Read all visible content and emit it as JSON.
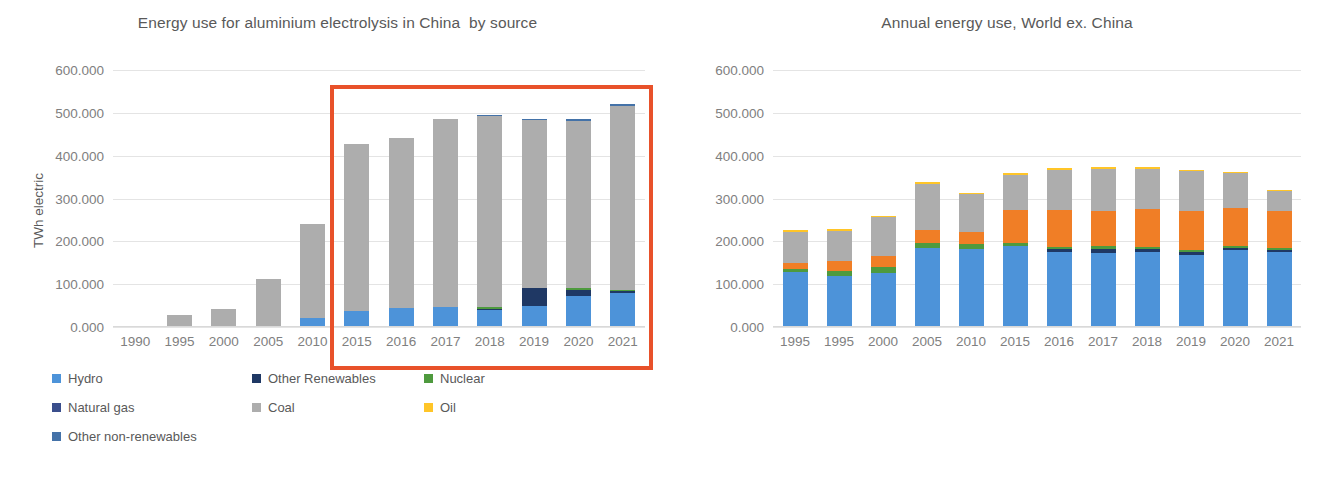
{
  "chart_data": [
    {
      "id": "china",
      "type": "bar",
      "stacked": true,
      "title": "Energy use for aluminium electrolysis in China  by source",
      "xlabel": "",
      "ylabel": "TWh electric",
      "ylim": [
        0,
        600
      ],
      "yticks": [
        "0.000",
        "100.000",
        "200.000",
        "300.000",
        "400.000",
        "500.000",
        "600.000"
      ],
      "ytick_values": [
        0,
        100,
        200,
        300,
        400,
        500,
        600
      ],
      "grid": true,
      "legend_position": "bottom",
      "categories": [
        "1990",
        "1995",
        "2000",
        "2005",
        "2010",
        "2015",
        "2016",
        "2017",
        "2018",
        "2019",
        "2020",
        "2021"
      ],
      "series": [
        {
          "name": "Hydro",
          "color": "#4D93D9",
          "values": [
            0,
            0,
            0,
            3.0,
            22.0,
            38.0,
            45.0,
            47.0,
            40.0,
            50.0,
            73.0,
            80.0
          ]
        },
        {
          "name": "Other Renewables",
          "color": "#1F3864",
          "values": [
            0,
            0,
            0,
            0,
            0,
            0,
            0,
            0,
            2.0,
            41.0,
            14.0,
            3.0
          ]
        },
        {
          "name": "Nuclear",
          "color": "#4E9A3E",
          "values": [
            0,
            0,
            0,
            0,
            0,
            0,
            0,
            0,
            4.0,
            1.0,
            3.0,
            4.0
          ]
        },
        {
          "name": "Natural gas",
          "color": "#3A4E8C",
          "values": [
            0,
            0,
            0,
            0,
            0,
            0,
            0,
            0,
            0,
            0,
            0,
            0
          ]
        },
        {
          "name": "Coal",
          "color": "#ADADAD",
          "values": [
            0,
            28.0,
            43.0,
            109.0,
            218.0,
            389.0,
            396.0,
            438.0,
            446.0,
            392.0,
            392.0,
            429.0
          ]
        },
        {
          "name": "Oil",
          "color": "#FFC528",
          "values": [
            0,
            0,
            0,
            0,
            0,
            0,
            0,
            0,
            0,
            0,
            0,
            0
          ]
        },
        {
          "name": "Other non-renewables",
          "color": "#4472A8",
          "values": [
            0,
            0,
            0,
            0,
            0,
            0,
            0,
            0,
            3.0,
            2.0,
            4.0,
            4.0
          ]
        }
      ],
      "totals": [
        0,
        28,
        43,
        112,
        240,
        427,
        441,
        485,
        495,
        486,
        486,
        520
      ],
      "highlight": {
        "label": "2015-2021 highlight box",
        "color": "#E8512A",
        "from": "2015",
        "to": "2021"
      },
      "legend": [
        {
          "label": "Hydro",
          "color": "#4D93D9"
        },
        {
          "label": "Other Renewables",
          "color": "#1F3864"
        },
        {
          "label": "Nuclear",
          "color": "#4E9A3E"
        },
        {
          "label": "Natural gas",
          "color": "#3A4E8C"
        },
        {
          "label": "Coal",
          "color": "#ADADAD"
        },
        {
          "label": "Oil",
          "color": "#FFC528"
        },
        {
          "label": "Other non-renewables",
          "color": "#4472A8"
        }
      ]
    },
    {
      "id": "world",
      "type": "bar",
      "stacked": true,
      "title": "Annual energy use, World ex. China",
      "xlabel": "",
      "ylabel": "TWh electric",
      "ylim": [
        0,
        600
      ],
      "yticks": [
        "0.000",
        "100.000",
        "200.000",
        "300.000",
        "400.000",
        "500.000",
        "600.000"
      ],
      "ytick_values": [
        0,
        100,
        200,
        300,
        400,
        500,
        600
      ],
      "grid": true,
      "legend_position": "bottom",
      "categories": [
        "1995",
        "1995",
        "2000",
        "2005",
        "2010",
        "2015",
        "2016",
        "2017",
        "2018",
        "2019",
        "2020",
        "2021"
      ],
      "series": [
        {
          "name": "Hydro",
          "color": "#4D93D9",
          "values": [
            128.0,
            120.0,
            127.0,
            185.0,
            182.0,
            188.0,
            175.0,
            172.0,
            176.0,
            168.0,
            180.0,
            176.0
          ]
        },
        {
          "name": "Other Renewables",
          "color": "#1F3864",
          "values": [
            0,
            0,
            0,
            0,
            0,
            0,
            7.0,
            10.0,
            5.0,
            6.0,
            4.0,
            3.0
          ]
        },
        {
          "name": "Nuclear",
          "color": "#4E9A3E",
          "values": [
            8.0,
            10.0,
            12.0,
            12.0,
            11.0,
            9.0,
            6.0,
            6.0,
            6.0,
            5.0,
            5.0,
            5.0
          ]
        },
        {
          "name": "Natural gas",
          "color": "#F07E26",
          "values": [
            14.0,
            25.0,
            26.0,
            30.0,
            28.0,
            77.0,
            85.0,
            84.0,
            89.0,
            92.0,
            90.0,
            86.0
          ]
        },
        {
          "name": "Coal",
          "color": "#ADADAD",
          "values": [
            72.0,
            69.0,
            91.0,
            107.0,
            89.0,
            82.0,
            94.0,
            98.0,
            94.0,
            93.0,
            80.0,
            48.0
          ]
        },
        {
          "name": "Oil",
          "color": "#FFC528",
          "values": [
            4.0,
            4.0,
            4.0,
            4.0,
            4.0,
            4.0,
            4.0,
            4.0,
            3.0,
            2.0,
            2.0,
            2.0
          ]
        },
        {
          "name": "Other non-renewables",
          "color": "#4472A8",
          "values": [
            0,
            0,
            0,
            0,
            0,
            0,
            0,
            0,
            0,
            0,
            0,
            0
          ]
        }
      ],
      "totals": [
        226,
        228,
        260,
        338,
        314,
        360,
        371,
        374,
        373,
        366,
        361,
        320
      ],
      "highlight": {
        "label": "2015-2021 highlight box",
        "color": "#E8512A",
        "from": "2015",
        "to": "2021"
      },
      "legend": [
        {
          "label": "Hydro",
          "color": "#4D93D9"
        },
        {
          "label": "Other Renewables",
          "color": "#1F3864"
        },
        {
          "label": "Nuclear",
          "color": "#4E9A3E"
        },
        {
          "label": "Natural gas",
          "color": "#F07E26"
        },
        {
          "label": "Coal",
          "color": "#ADADAD"
        },
        {
          "label": "Oil",
          "color": "#FFC528"
        },
        {
          "label": "Other non-renewables",
          "color": "#4472A8"
        }
      ]
    }
  ]
}
